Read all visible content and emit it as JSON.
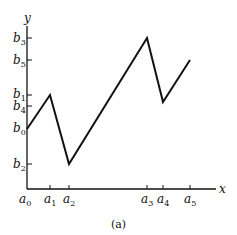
{
  "figure": {
    "caption": "(a)",
    "x_axis_label": "x",
    "y_axis_label": "y"
  },
  "x_ticks": [
    {
      "base": "a",
      "sub": "0",
      "x": 27
    },
    {
      "base": "a",
      "sub": "1",
      "x": 50
    },
    {
      "base": "a",
      "sub": "2",
      "x": 69
    },
    {
      "base": "a",
      "sub": "3",
      "x": 147
    },
    {
      "base": "a",
      "sub": "4",
      "x": 163
    },
    {
      "base": "a",
      "sub": "5",
      "x": 190
    }
  ],
  "y_ticks": [
    {
      "base": "b",
      "sub": "3",
      "y": 38
    },
    {
      "base": "b",
      "sub": "5",
      "y": 60
    },
    {
      "base": "b",
      "sub": "1",
      "y": 95
    },
    {
      "base": "b",
      "sub": "4",
      "y": 106
    },
    {
      "base": "b",
      "sub": "0",
      "y": 129
    },
    {
      "base": "b",
      "sub": "2",
      "y": 164
    }
  ],
  "polyline": [
    {
      "x": "a0",
      "y": "b0"
    },
    {
      "x": "a1",
      "y": "b1"
    },
    {
      "x": "a2",
      "y": "b2"
    },
    {
      "x": "a3",
      "y": "b3"
    },
    {
      "x": "a4",
      "y": "b4"
    },
    {
      "x": "a5",
      "y": "b5"
    }
  ],
  "colors": {
    "line": "#111111",
    "background": "#ffffff"
  }
}
